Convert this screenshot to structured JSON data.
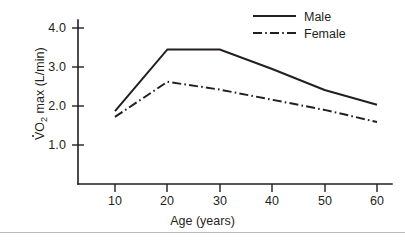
{
  "chart_data": {
    "type": "line",
    "title": "",
    "xlabel": "Age (years)",
    "ylabel": "VO2 max (L/min)",
    "ylabel_parts": {
      "v": "V",
      "o": "O",
      "sub": "2",
      "rest": " max (L/min)"
    },
    "x": [
      10,
      20,
      30,
      40,
      50,
      60
    ],
    "xlim": [
      5,
      63
    ],
    "ylim": [
      0.0,
      4.4
    ],
    "xticks": [
      "10",
      "20",
      "30",
      "40",
      "50",
      "60"
    ],
    "yticks": [
      "1.0",
      "2.0",
      "3.0",
      "4.0"
    ],
    "ytick_values": [
      1.0,
      2.0,
      3.0,
      4.0
    ],
    "grid": false,
    "legend_position": "top-right",
    "series": [
      {
        "name": "Male",
        "style": "solid",
        "color": "#231f20",
        "values": [
          1.87,
          3.45,
          3.45,
          2.95,
          2.41,
          2.03
        ]
      },
      {
        "name": "Female",
        "style": "dash-dot",
        "color": "#231f20",
        "values": [
          1.72,
          2.62,
          2.42,
          2.16,
          1.9,
          1.59
        ]
      }
    ]
  },
  "legend": {
    "items": [
      {
        "label": "Male"
      },
      {
        "label": "Female"
      }
    ]
  }
}
